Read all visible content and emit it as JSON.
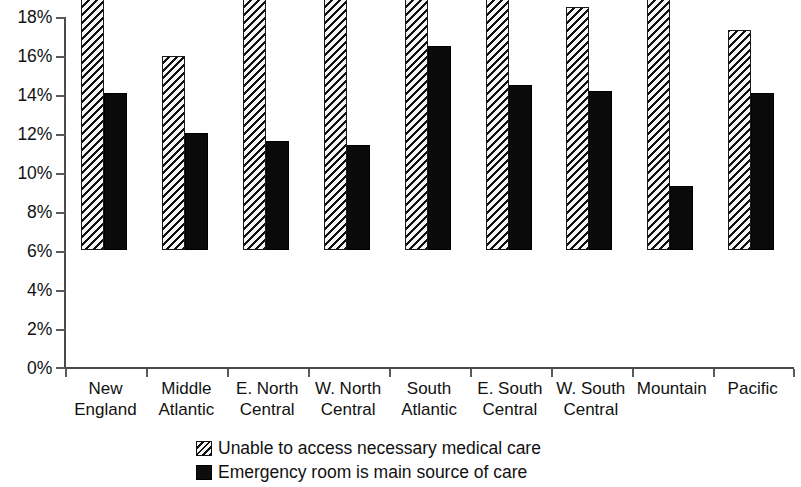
{
  "chart_data": {
    "type": "bar",
    "title": "",
    "subtitle": "",
    "xlabel": "",
    "ylabel": "",
    "ylim": [
      0,
      18
    ],
    "y_tick_labels": [
      "18%",
      "16%",
      "14%",
      "12%",
      "10%",
      "8%",
      "6%",
      "4%",
      "2%",
      "0%"
    ],
    "y_tick_values": [
      18,
      16,
      14,
      12,
      10,
      8,
      6,
      4,
      2,
      0
    ],
    "grid": false,
    "legend_position": "bottom",
    "categories": [
      "New England",
      "Middle Atlantic",
      "E. North Central",
      "W. North Central",
      "South Atlantic",
      "E. South Central",
      "W. South Central",
      "Mountain",
      "Pacific"
    ],
    "category_lines": [
      [
        "New",
        "England"
      ],
      [
        "Middle",
        "Atlantic"
      ],
      [
        "E. North",
        "Central"
      ],
      [
        "W. North",
        "Central"
      ],
      [
        "South",
        "Atlantic"
      ],
      [
        "E. South",
        "Central"
      ],
      [
        "W. South",
        "Central"
      ],
      [
        "Mountain",
        ""
      ],
      [
        "Pacific",
        ""
      ]
    ],
    "series": [
      {
        "name": "Unable to access necessary medical care",
        "pattern": "diagonal-hatch",
        "values": [
          14.4,
          10.0,
          13.5,
          15.7,
          14.5,
          13.9,
          12.5,
          14.2,
          11.3
        ]
      },
      {
        "name": "Emergency room is main source of care",
        "pattern": "solid-black",
        "values": [
          8.1,
          6.0,
          5.6,
          5.4,
          10.5,
          8.5,
          8.2,
          3.3,
          8.1
        ]
      }
    ]
  },
  "legend": {
    "items": [
      {
        "label": "Unable to access necessary medical care",
        "swatch": "hatched-swatch"
      },
      {
        "label": "Emergency room is main source of care",
        "swatch": "solid-swatch"
      }
    ]
  },
  "colors": {
    "series_1_fill": "#f2f2f2",
    "series_1_hatch": "#111111",
    "series_2_fill": "#0a0a0a",
    "axis": "#4a4a4a",
    "text": "#111111",
    "background": "#ffffff"
  }
}
